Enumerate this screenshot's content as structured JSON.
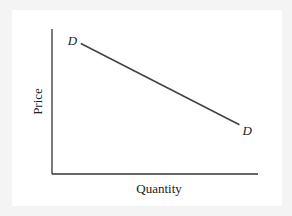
{
  "chart_data": {
    "type": "line",
    "title": "",
    "xlabel": "Quantity",
    "ylabel": "Price",
    "xlim": [
      0,
      10
    ],
    "ylim": [
      0,
      10
    ],
    "grid": false,
    "series": [
      {
        "name": "Demand",
        "x": [
          1.4,
          9.1
        ],
        "y": [
          9.0,
          3.4
        ],
        "start_label": "D",
        "end_label": "D"
      }
    ],
    "line_color": "#444444"
  }
}
